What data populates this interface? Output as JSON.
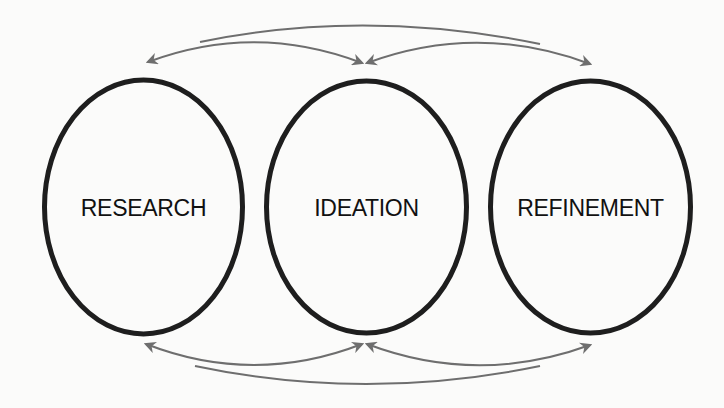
{
  "diagram": {
    "type": "cyclic-process",
    "nodes": [
      {
        "id": "research",
        "label": "RESEARCH"
      },
      {
        "id": "ideation",
        "label": "IDEATION"
      },
      {
        "id": "refinement",
        "label": "REFINEMENT"
      }
    ],
    "edges": [
      {
        "from": "ideation",
        "to": "research",
        "position": "top",
        "style": "arrow"
      },
      {
        "from": "research",
        "to": "ideation",
        "position": "top",
        "style": "arrow"
      },
      {
        "from": "refinement",
        "to": "ideation",
        "position": "top",
        "style": "arrow"
      },
      {
        "from": "research",
        "to": "refinement",
        "position": "top",
        "style": "arrow"
      },
      {
        "from": "ideation",
        "to": "research",
        "position": "bottom",
        "style": "arrow"
      },
      {
        "from": "refinement",
        "to": "ideation",
        "position": "bottom",
        "style": "arrow"
      },
      {
        "from": "ideation",
        "to": "refinement",
        "position": "bottom",
        "style": "arrow"
      },
      {
        "from": "refinement",
        "to": "research",
        "position": "bottom",
        "style": "arrow"
      }
    ],
    "colors": {
      "ellipse_stroke": "#1e1e1e",
      "arrow_stroke": "#6e6e6e",
      "text": "#111111",
      "background": "#fbfbfa"
    }
  }
}
